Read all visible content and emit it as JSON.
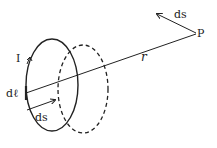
{
  "diagram": {
    "labels": {
      "current": "I",
      "line_element": "dℓ",
      "loop_displacement": "ds",
      "point_displacement": "ds",
      "point": "P",
      "distance": "r"
    },
    "colors": {
      "stroke": "#222222",
      "background": "#ffffff"
    },
    "elements": {
      "solid_loop": "current loop (solid ellipse)",
      "dashed_loop": "displaced loop (dashed ellipse)",
      "distance_line": "line from dℓ to P",
      "arrow_ds_loop": "displacement arrow on loop",
      "arrow_ds_point": "displacement arrow at P",
      "current_arrow": "arrow indicating current direction"
    }
  }
}
